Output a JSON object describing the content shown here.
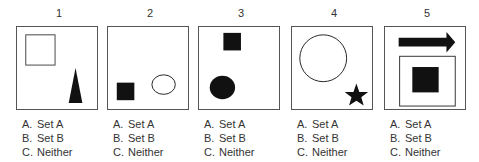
{
  "items": [
    {
      "number": "1",
      "shapes": [
        "hollow-square",
        "filled-triangle"
      ],
      "options": [
        {
          "key": "A.",
          "label": "Set A"
        },
        {
          "key": "B.",
          "label": "Set B"
        },
        {
          "key": "C.",
          "label": "Neither"
        }
      ]
    },
    {
      "number": "2",
      "shapes": [
        "filled-square",
        "hollow-circle"
      ],
      "options": [
        {
          "key": "A.",
          "label": "Set A"
        },
        {
          "key": "B.",
          "label": "Set B"
        },
        {
          "key": "C.",
          "label": "Neither"
        }
      ]
    },
    {
      "number": "3",
      "shapes": [
        "filled-square",
        "filled-circle"
      ],
      "options": [
        {
          "key": "A.",
          "label": "Set A"
        },
        {
          "key": "B.",
          "label": "Set B"
        },
        {
          "key": "C.",
          "label": "Neither"
        }
      ]
    },
    {
      "number": "4",
      "shapes": [
        "hollow-circle",
        "filled-star"
      ],
      "options": [
        {
          "key": "A.",
          "label": "Set A"
        },
        {
          "key": "B.",
          "label": "Set B"
        },
        {
          "key": "C.",
          "label": "Neither"
        }
      ]
    },
    {
      "number": "5",
      "shapes": [
        "filled-arrow-right",
        "hollow-square",
        "filled-square"
      ],
      "options": [
        {
          "key": "A.",
          "label": "Set A"
        },
        {
          "key": "B.",
          "label": "Set B"
        },
        {
          "key": "C.",
          "label": "Neither"
        }
      ]
    }
  ],
  "colors": {
    "shape_fill": "#111111",
    "border": "#555555"
  }
}
